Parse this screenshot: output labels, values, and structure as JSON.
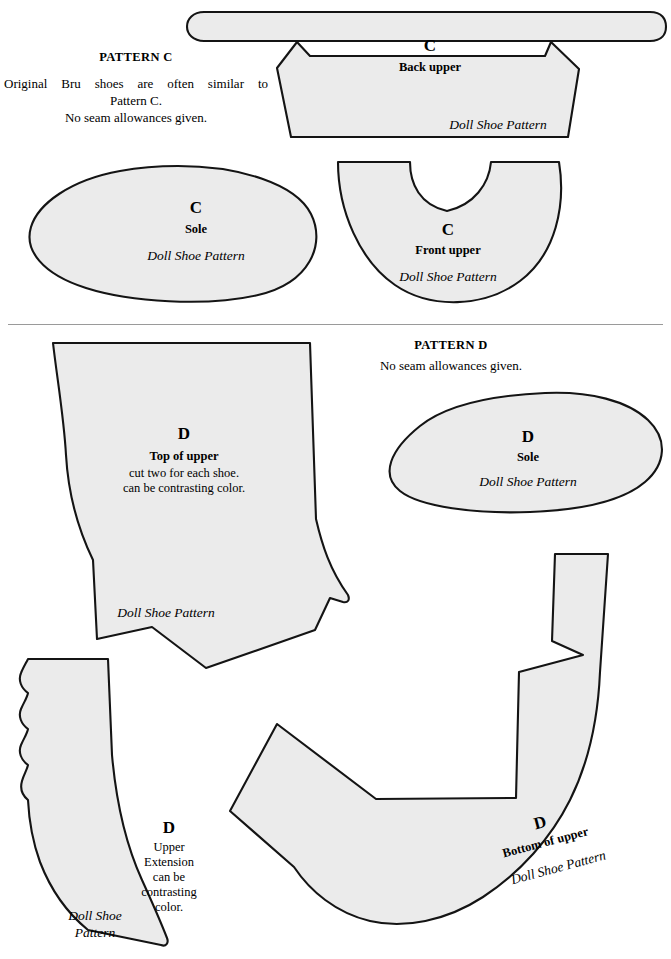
{
  "document": {
    "kind": "doll-shoe-sewing-pattern-sheet",
    "brand_mark": "Doll Shoe Pattern"
  },
  "pattern_c": {
    "title": "PATTERN C",
    "description_line1": "Original Bru shoes are often similar to",
    "description_line2": "Pattern C.",
    "description_line3": "No seam allowances given.",
    "pieces": {
      "back_upper": {
        "letter": "C",
        "name": "Back upper",
        "brand": "Doll Shoe Pattern"
      },
      "sole": {
        "letter": "C",
        "name": "Sole",
        "brand": "Doll Shoe Pattern"
      },
      "front_upper": {
        "letter": "C",
        "name": "Front upper",
        "brand": "Doll Shoe Pattern"
      }
    }
  },
  "pattern_d": {
    "title": "PATTERN D",
    "description_line1": "No seam allowances given.",
    "pieces": {
      "top_of_upper": {
        "letter": "D",
        "name": "Top of upper",
        "note_line1": "cut two for each shoe.",
        "note_line2": "can be contrasting color.",
        "brand": "Doll Shoe Pattern"
      },
      "sole": {
        "letter": "D",
        "name": "Sole",
        "brand": "Doll Shoe Pattern"
      },
      "upper_extension": {
        "letter": "D",
        "name_line1": "Upper",
        "name_line2": "Extension",
        "note_line1": "can be",
        "note_line2": "contrasting",
        "note_line3": "color.",
        "brand_line1": "Doll Shoe",
        "brand_line2": "Pattern"
      },
      "bottom_of_upper": {
        "letter": "D",
        "name": "Bottom of upper",
        "brand": "Doll Shoe Pattern"
      }
    }
  },
  "colors": {
    "piece_fill": "#ebebeb",
    "piece_stroke": "#141414",
    "divider": "#9a9a9a",
    "page_background": "#ffffff",
    "text": "#000000"
  }
}
